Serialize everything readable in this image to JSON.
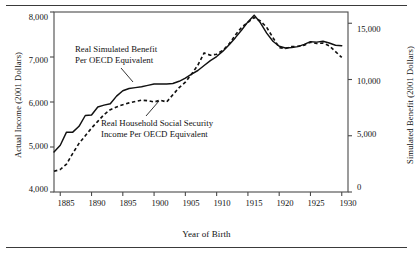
{
  "figure": {
    "xlabel": "Year of Birth",
    "ylabel_left": "Actual Income (2001 Dollars)",
    "ylabel_right": "Simulated Benefit (2001 Dollars)",
    "annotations": {
      "simulated_line1": "Real Simulated Benefit",
      "simulated_line2": "Per OECD Equivalent",
      "household_line1": "Real Household Social Security",
      "household_line2": "Income Per OECD Equivalent"
    },
    "ticks": {
      "x": [
        "1885",
        "1890",
        "1895",
        "1900",
        "1905",
        "1910",
        "1915",
        "1920",
        "1925",
        "1930"
      ],
      "y_left": [
        "8,000",
        "7,000",
        "6,000",
        "5,000",
        "4,000"
      ],
      "y_right": [
        "15,000",
        "10,000",
        "5,000",
        "0"
      ]
    },
    "colors": {
      "line": "#111111",
      "frame": "#4a4a4a",
      "background": "#ffffff"
    }
  },
  "chart_data": {
    "type": "line",
    "title": "",
    "xlabel": "Year of Birth",
    "ylabel": "Actual Income (2001 Dollars)",
    "ylabel_secondary": "Simulated Benefit (2001 Dollars)",
    "xlim": [
      1884,
      1931
    ],
    "ylim": [
      4000,
      8000
    ],
    "ylim_secondary": [
      0,
      16000
    ],
    "xticks": [
      1885,
      1890,
      1895,
      1900,
      1905,
      1910,
      1915,
      1920,
      1925,
      1930
    ],
    "yticks": [
      4000,
      5000,
      6000,
      7000,
      8000
    ],
    "yticks_secondary": [
      0,
      5000,
      10000,
      15000
    ],
    "grid": false,
    "legend": "annotations-inline",
    "series": [
      {
        "name": "Real Simulated Benefit Per OECD Equivalent",
        "style": "solid",
        "axis": "left",
        "x": [
          1884,
          1885,
          1886,
          1887,
          1888,
          1889,
          1890,
          1891,
          1892,
          1893,
          1894,
          1895,
          1896,
          1897,
          1898,
          1899,
          1900,
          1901,
          1902,
          1903,
          1904,
          1905,
          1906,
          1907,
          1908,
          1909,
          1910,
          1911,
          1912,
          1913,
          1914,
          1915,
          1916,
          1917,
          1918,
          1919,
          1920,
          1921,
          1922,
          1923,
          1924,
          1925,
          1926,
          1927,
          1928,
          1929,
          1930
        ],
        "values": [
          4890,
          5040,
          5330,
          5330,
          5460,
          5700,
          5710,
          5890,
          5930,
          5960,
          6130,
          6250,
          6300,
          6320,
          6340,
          6370,
          6400,
          6400,
          6400,
          6410,
          6460,
          6530,
          6620,
          6700,
          6810,
          6920,
          7010,
          7130,
          7270,
          7430,
          7600,
          7780,
          7930,
          7760,
          7530,
          7350,
          7240,
          7200,
          7210,
          7230,
          7280,
          7340,
          7330,
          7350,
          7310,
          7260,
          7250
        ]
      },
      {
        "name": "Real Household Social Security Income Per OECD Equivalent",
        "style": "dashed",
        "axis": "right",
        "x": [
          1884,
          1885,
          1886,
          1887,
          1888,
          1889,
          1890,
          1891,
          1892,
          1893,
          1894,
          1895,
          1896,
          1897,
          1898,
          1899,
          1900,
          1901,
          1902,
          1903,
          1904,
          1905,
          1906,
          1907,
          1908,
          1909,
          1910,
          1911,
          1912,
          1913,
          1914,
          1915,
          1916,
          1917,
          1918,
          1919,
          1920,
          1921,
          1922,
          1923,
          1924,
          1925,
          1926,
          1927,
          1928,
          1929,
          1930
        ],
        "values_left_scale": [
          4460,
          4500,
          4620,
          4860,
          5080,
          5250,
          5420,
          5570,
          5720,
          5830,
          5890,
          5940,
          5980,
          6010,
          6040,
          6030,
          6000,
          6040,
          6000,
          6160,
          6320,
          6440,
          6620,
          6820,
          7090,
          7040,
          7060,
          7150,
          7290,
          7490,
          7660,
          7770,
          7880,
          7800,
          7660,
          7430,
          7210,
          7190,
          7230,
          7240,
          7260,
          7330,
          7300,
          7310,
          7250,
          7120,
          6990
        ],
        "values_right_scale": [
          1840,
          2000,
          2480,
          3440,
          4320,
          5000,
          5680,
          6280,
          6880,
          7320,
          7560,
          7760,
          7920,
          8040,
          8160,
          8120,
          8000,
          8160,
          8000,
          8640,
          9280,
          9760,
          10480,
          11280,
          12360,
          12160,
          12240,
          12600,
          13160,
          13960,
          14640,
          15080,
          15520,
          15200,
          14640,
          13720,
          12840,
          12760,
          12920,
          12960,
          13040,
          13320,
          13200,
          13240,
          13000,
          12480,
          11960
        ]
      }
    ]
  }
}
